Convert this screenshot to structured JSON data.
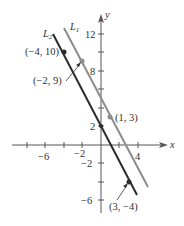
{
  "figure": {
    "axes": {
      "x_label": "x",
      "y_label": "y",
      "x_ticks": [
        "-6",
        "-2",
        "4"
      ],
      "y_ticks": [
        "12",
        "8",
        "2",
        "-2",
        "-6"
      ]
    },
    "lines": [
      {
        "name": "L1",
        "label_main": "L",
        "label_sub": "1",
        "color": "#8c8c8c",
        "points": [
          "(-2, 9)",
          "(1, 3)"
        ]
      },
      {
        "name": "L2",
        "label_main": "L",
        "label_sub": "2",
        "color": "#2b2b2b",
        "points": [
          "(-4, 10)",
          "(3, -4)"
        ]
      }
    ],
    "point_labels": {
      "p_neg4_10": "(−4, 10)",
      "p_neg2_9": "(−2, 9)",
      "p_1_3": "(1, 3)",
      "p_3_neg4": "(3, −4)"
    },
    "tick_labels": {
      "x_neg6": "−6",
      "x_neg2": "−2",
      "x_4": "4",
      "y_12": "12",
      "y_8": "8",
      "y_2": "2",
      "y_neg2": "−2",
      "y_neg6": "−6"
    }
  }
}
